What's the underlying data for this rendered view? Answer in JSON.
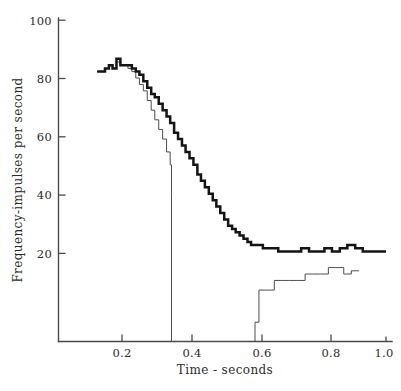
{
  "figure": {
    "background_color": "#ffffff",
    "axis_color": "#4a4a4a",
    "trace_thick_color": "#141414",
    "trace_thin_color": "#4d4d4d"
  },
  "axes": {
    "x_title": "Time - seconds",
    "y_title": "Frequency-impulses per second",
    "x_ticks": [
      "0.2",
      "0.4",
      "0.6",
      "0.8",
      "1.0"
    ],
    "y_ticks": [
      "100",
      "80",
      "60",
      "40",
      "20"
    ]
  },
  "caption": {
    "partial_bottom_line": ""
  },
  "chart_data": {
    "type": "line",
    "title": "",
    "subtitle": "",
    "xlabel": "Time - seconds",
    "ylabel": "Frequency-impulses per second",
    "xlim": [
      0.0,
      1.05
    ],
    "ylim": [
      0,
      100
    ],
    "xticks": [
      0.2,
      0.4,
      0.6,
      0.8,
      1.0
    ],
    "yticks": [
      20,
      40,
      60,
      80,
      100
    ],
    "grid": false,
    "legend": null,
    "step_style": "post",
    "annotations": [
      "Thin trace falls to zero between about 0.35 s and 0.60 s, then recovers in steps to about 22 impulses/s.",
      "Thick trace decays smoothly in steps from a peak near 87 to a plateau near 28 impulses/s."
    ],
    "series": [
      {
        "name": "thick-trace",
        "line_width": "thick",
        "x": [
          0.118,
          0.13,
          0.142,
          0.154,
          0.165,
          0.177,
          0.189,
          0.2,
          0.212,
          0.224,
          0.236,
          0.247,
          0.259,
          0.271,
          0.283,
          0.294,
          0.306,
          0.318,
          0.33,
          0.341,
          0.353,
          0.365,
          0.377,
          0.388,
          0.4,
          0.412,
          0.424,
          0.435,
          0.447,
          0.459,
          0.471,
          0.482,
          0.494,
          0.506,
          0.518,
          0.53,
          0.541,
          0.553,
          0.565,
          0.577,
          0.588,
          0.6,
          0.624,
          0.647,
          0.671,
          0.694,
          0.718,
          0.741,
          0.765,
          0.788,
          0.812,
          0.835,
          0.859,
          0.882,
          0.906,
          0.929,
          0.953,
          0.976,
          1.0
        ],
        "y": [
          84,
          84,
          85,
          86,
          85,
          88,
          86,
          86,
          86,
          85,
          84,
          83,
          81,
          79,
          77,
          76,
          74,
          72,
          70,
          68,
          65,
          63,
          61,
          59,
          57,
          55,
          52,
          50,
          48,
          46,
          44,
          42,
          40,
          38,
          36,
          35,
          34,
          33,
          32,
          31,
          30,
          30,
          29,
          29,
          28,
          28,
          28,
          29,
          28,
          28,
          29,
          28,
          29,
          30,
          29,
          28,
          28,
          28,
          28
        ]
      },
      {
        "name": "thin-trace",
        "line_width": "thin",
        "x": [
          0.118,
          0.13,
          0.142,
          0.154,
          0.165,
          0.177,
          0.189,
          0.2,
          0.212,
          0.224,
          0.236,
          0.247,
          0.259,
          0.271,
          0.283,
          0.294,
          0.306,
          0.318,
          0.33,
          0.341,
          0.345,
          0.345,
          0.6,
          0.6,
          0.612,
          0.635,
          0.659,
          0.682,
          0.706,
          0.729,
          0.753,
          0.776,
          0.8,
          0.824,
          0.847,
          0.871,
          0.894,
          0.918
        ],
        "y": [
          84,
          84,
          85,
          86,
          85,
          87,
          86,
          86,
          85,
          84,
          82,
          80,
          78,
          75,
          72,
          69,
          66,
          63,
          59,
          55,
          46,
          0,
          0,
          6,
          16,
          16,
          19,
          19,
          19,
          19,
          21,
          21,
          21,
          23,
          23,
          21,
          22,
          22
        ]
      }
    ]
  }
}
